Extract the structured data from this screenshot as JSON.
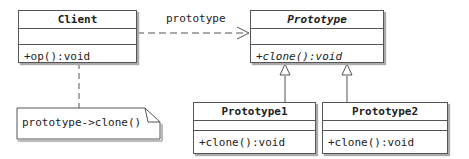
{
  "classes": {
    "client": {
      "name": "Client",
      "operations": [
        "+op():void"
      ]
    },
    "prototype": {
      "name": "Prototype",
      "operations": [
        "+clone():void"
      ],
      "abstract": true
    },
    "prototype1": {
      "name": "Prototype1",
      "operations": [
        "+clone():void"
      ]
    },
    "prototype2": {
      "name": "Prototype2",
      "operations": [
        "+clone():void"
      ]
    }
  },
  "associations": [
    {
      "from": "Client",
      "to": "Prototype",
      "label": "prototype",
      "style": "dashed-arrow"
    }
  ],
  "generalizations": [
    {
      "from": "Prototype1",
      "to": "Prototype"
    },
    {
      "from": "Prototype2",
      "to": "Prototype"
    }
  ],
  "note": {
    "text": "prototype->clone()",
    "attached_to": "Client"
  }
}
